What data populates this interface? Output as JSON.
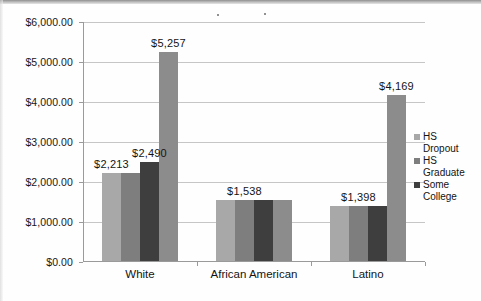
{
  "chart_data": {
    "type": "bar",
    "title": "",
    "subtitle": "",
    "xlabel": "",
    "ylabel": "",
    "categories": [
      "White",
      "African American",
      "Latino"
    ],
    "series": [
      {
        "name": "HS Dropout",
        "color": "#a8a8a8",
        "values": [
          2213,
          1538,
          1398
        ],
        "labels": [
          "$2,213",
          "",
          ""
        ]
      },
      {
        "name": "HS Graduate",
        "color": "#7e7e7e",
        "values": [
          2213,
          1538,
          1398
        ],
        "labels": [
          "",
          "$1,538",
          "$1,398"
        ]
      },
      {
        "name": "Some College",
        "color": "#3e3e3e",
        "values": [
          2490,
          1538,
          1398
        ],
        "labels": [
          "$2,490",
          "",
          ""
        ]
      },
      {
        "name": "",
        "color": "#8c8c8c",
        "values": [
          5257,
          1538,
          4169
        ],
        "labels": [
          "$5,257",
          "",
          "$4,169"
        ]
      }
    ],
    "ylim": [
      0,
      6000
    ],
    "ytick_step": 1000,
    "ytick_labels": [
      "$0.00",
      "$1,000.00",
      "$2,000.00",
      "$3,000.00",
      "$4,000.00",
      "$5,000.00",
      "$6,000.00"
    ],
    "grid": true,
    "legend_position": "right",
    "value_prefix": "$"
  },
  "legend": {
    "items": [
      {
        "label_line1": "HS",
        "label_line2": "Dropout",
        "color": "#a8a8a8"
      },
      {
        "label_line1": "HS",
        "label_line2": "Graduate",
        "color": "#7e7e7e"
      },
      {
        "label_line1": "Some",
        "label_line2": "College",
        "color": "#3e3e3e"
      }
    ]
  }
}
